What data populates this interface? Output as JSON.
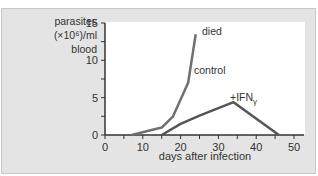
{
  "chart_data": {
    "type": "line",
    "title": "",
    "xlabel": "days after infection",
    "ylabel": "parasites (×10⁶)/ml blood",
    "ylabel_lines": [
      "parasites",
      "(×10⁶)/ml",
      "blood"
    ],
    "xlim": [
      0,
      50
    ],
    "ylim": [
      0,
      15
    ],
    "xticks": [
      0,
      10,
      20,
      30,
      40,
      50
    ],
    "yticks": [
      0,
      5,
      10,
      15
    ],
    "grid": false,
    "series": [
      {
        "name": "control",
        "color": "#707070",
        "x": [
          7,
          15,
          18,
          22,
          24
        ],
        "y": [
          0,
          1,
          2.5,
          7,
          13.5
        ]
      },
      {
        "name": "+IFNγ",
        "color": "#555555",
        "x": [
          15,
          20,
          25,
          30,
          34,
          46
        ],
        "y": [
          0,
          1.5,
          2.6,
          3.6,
          4.4,
          0
        ]
      }
    ],
    "annotations": [
      "died",
      "control",
      "+IFNγ"
    ]
  },
  "labels": {
    "ylabel_1": "parasites",
    "ylabel_2": "(×10⁶)/ml",
    "ylabel_3": "blood",
    "xlabel": "days after infection",
    "died": "died",
    "control": "control",
    "ifn": "+IFN",
    "ifn_sub": "γ"
  }
}
